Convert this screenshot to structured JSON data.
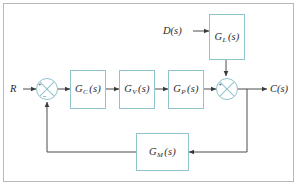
{
  "figure": {
    "background_color": "#ffffff",
    "frame_color": "#b9b9b9",
    "block_border_color": "#8fc4cc",
    "line_color": "#4d4d4d",
    "text_color": "#2b2b2b"
  },
  "signals": {
    "reference_input": "R",
    "disturbance_input": "D(s)",
    "controlled_output": "C(s)"
  },
  "blocks": [
    {
      "id": "controller",
      "label_main": "G",
      "label_sub": "C",
      "label_tail": "(s)",
      "full": "G_C(s)"
    },
    {
      "id": "valve",
      "label_main": "G",
      "label_sub": "V",
      "label_tail": "(s)",
      "full": "G_V(s)"
    },
    {
      "id": "process",
      "label_main": "G",
      "label_sub": "P",
      "label_tail": "(s)",
      "full": "G_P(s)"
    },
    {
      "id": "load",
      "label_main": "G",
      "label_sub": "L",
      "label_tail": "(s)",
      "full": "G_L(s)"
    },
    {
      "id": "measurement",
      "label_main": "G",
      "label_sub": "M",
      "label_tail": "(s)",
      "full": "G_M(s)"
    }
  ],
  "summers": {
    "error_junction": {
      "plus_sign": "+",
      "minus_sign": "−"
    },
    "output_junction": {
      "plus_sign": "+",
      "second_sign": "+"
    }
  }
}
